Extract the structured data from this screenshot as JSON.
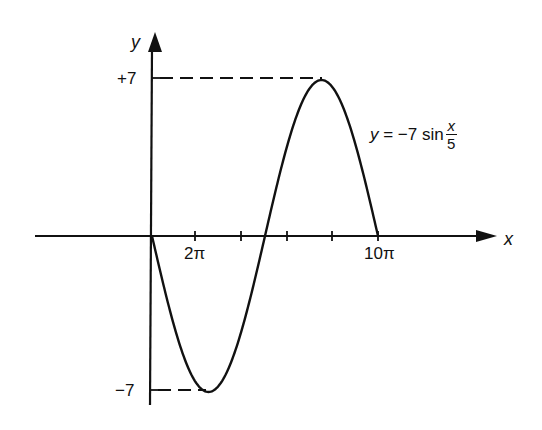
{
  "chart_data": {
    "type": "line",
    "title": "",
    "function": "y = -7 sin(x/5)",
    "xlabel": "x",
    "ylabel": "y",
    "x_ticks": [
      "0",
      "2π",
      "4π",
      "6π",
      "8π",
      "10π"
    ],
    "x_tick_labels_visible": [
      "2π",
      "10π"
    ],
    "y_ticks": [
      "+7",
      "-7"
    ],
    "xlim": [
      "0",
      "10π"
    ],
    "ylim": [
      -7,
      7
    ],
    "key_points": [
      {
        "x": "0",
        "y": 0
      },
      {
        "x": "5π/2",
        "y": -7,
        "note": "minimum"
      },
      {
        "x": "5π",
        "y": 0
      },
      {
        "x": "15π/2",
        "y": 7,
        "note": "maximum"
      },
      {
        "x": "10π",
        "y": 0
      }
    ],
    "series": [
      {
        "name": "y = -7 sin x/5",
        "x": [
          0,
          3.1416,
          6.2832,
          7.854,
          9.4248,
          12.566,
          15.708,
          18.85,
          21.991,
          23.562,
          25.133,
          28.274,
          31.416
        ],
        "values": [
          0,
          -4.11,
          -6.66,
          -7.0,
          -6.66,
          -4.11,
          0,
          4.11,
          6.66,
          7.0,
          6.66,
          4.11,
          0
        ]
      }
    ],
    "annotations": [
      "dashed line from +7 on y-axis to maximum",
      "dashed line from -7 on y-axis to minimum"
    ],
    "grid": false,
    "legend": "none"
  },
  "labels": {
    "y_axis": "y",
    "x_axis": "x",
    "y_pos": "+7",
    "y_neg": "−7",
    "tick_2pi": "2π",
    "tick_10pi": "10π",
    "eq_lhs": "y",
    "eq_mid": " = −7 sin",
    "eq_num": "x",
    "eq_den": "5"
  },
  "colors": {
    "ink": "#111111",
    "background": "#ffffff"
  }
}
